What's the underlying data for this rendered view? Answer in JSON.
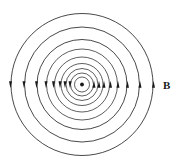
{
  "figure": {
    "background_color": "#ffffff",
    "line_color": "#1a1a1a",
    "width": 179,
    "height": 166
  },
  "labels": {
    "field_label": "B",
    "field_label_x": 163,
    "field_label_y": 80
  },
  "center_marker": {
    "name": "current-out-of-page-dot",
    "cx": 82,
    "cy": 84.5,
    "r": 1.9,
    "color": "#1a1a1a"
  },
  "chart_data": {
    "type": "scatter",
    "xlabel": "",
    "ylabel": "",
    "grid": false,
    "legend": [
      "B"
    ],
    "legend_position": "right",
    "center": [
      82,
      84.5
    ],
    "circulation": "counterclockwise",
    "circle_radii": [
      7.5,
      11.5,
      16,
      21,
      27.5,
      35.5,
      45,
      57.5,
      71
    ],
    "circle_count": 9,
    "arrow_head_side_right_direction": "up",
    "arrow_head_side_left_direction": "down",
    "arrow_radii_right": [
      12,
      17,
      22,
      28.5,
      36,
      45.5,
      58,
      71.5
    ],
    "arrow_radii_left": [
      12,
      17,
      22,
      28.5,
      36,
      45.5,
      58,
      71.5
    ],
    "annotations": [
      {
        "text": "B",
        "x": 163,
        "y": 86
      }
    ]
  }
}
